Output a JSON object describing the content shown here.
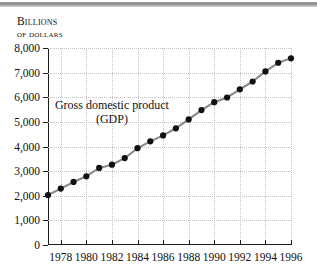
{
  "figure": {
    "top_rule_color": "#8e8e8e",
    "background": "#ffffff"
  },
  "axis_title": {
    "line1": "Billions",
    "line2": "of dollars"
  },
  "annotation": {
    "line1": "Gross domestic product",
    "line2": "(GDP)"
  },
  "chart_data": {
    "type": "line",
    "title": "",
    "subtitle": "",
    "xlabel": "",
    "ylabel": "Billions of dollars",
    "xlim": [
      1977,
      1996
    ],
    "ylim": [
      0,
      8000
    ],
    "grid": true,
    "legend": "none",
    "annotations": [
      {
        "text": "Gross domestic product (GDP)",
        "x": 1982.0,
        "y": 5400
      }
    ],
    "ytick_labels": [
      "0",
      "1,000",
      "2,000",
      "3,000",
      "4,000",
      "5,000",
      "6,000",
      "7,000",
      "8,000"
    ],
    "ytick_values": [
      0,
      1000,
      2000,
      3000,
      4000,
      5000,
      6000,
      7000,
      8000
    ],
    "xtick_labels": [
      "1978",
      "1980",
      "1982",
      "1984",
      "1986",
      "1988",
      "1990",
      "1992",
      "1994",
      "1996"
    ],
    "xtick_values": [
      1978,
      1980,
      1982,
      1984,
      1986,
      1988,
      1990,
      1992,
      1994,
      1996
    ],
    "marker": "filled-circle",
    "marker_color": "#111111",
    "line_color": "#8a8a8a",
    "x": [
      1977,
      1978,
      1979,
      1980,
      1981,
      1982,
      1983,
      1984,
      1985,
      1986,
      1987,
      1988,
      1989,
      1990,
      1991,
      1992,
      1993,
      1994,
      1995,
      1996
    ],
    "values": [
      2030,
      2290,
      2560,
      2790,
      3130,
      3260,
      3530,
      3930,
      4210,
      4450,
      4740,
      5100,
      5480,
      5800,
      5990,
      6320,
      6640,
      7050,
      7400,
      7580
    ],
    "series": [
      {
        "name": "Gross domestic product (GDP)",
        "values": [
          2030,
          2290,
          2560,
          2790,
          3130,
          3260,
          3530,
          3930,
          4210,
          4450,
          4740,
          5100,
          5480,
          5800,
          5990,
          6320,
          6640,
          7050,
          7400,
          7580
        ]
      }
    ]
  }
}
